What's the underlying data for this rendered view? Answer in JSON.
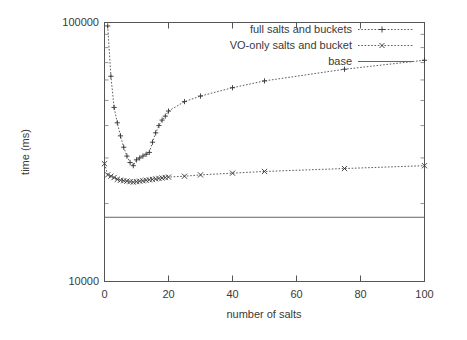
{
  "chart_data": {
    "type": "line",
    "title": "",
    "xlabel": "number of salts",
    "ylabel": "time (ms)",
    "xlim": [
      0,
      100
    ],
    "ylim": [
      10000,
      100000
    ],
    "yscale": "log",
    "xscale": "linear",
    "grid": false,
    "legend_position": "top-right",
    "xticks": [
      0,
      20,
      40,
      60,
      80,
      100
    ],
    "xtick_labels": [
      "0",
      "20",
      "40",
      "60",
      "80",
      "100"
    ],
    "yticks": [
      10000,
      100000
    ],
    "ytick_labels": [
      "10000",
      "100000"
    ],
    "series": [
      {
        "name": "full salts and buckets",
        "marker": "plus",
        "linestyle": "dotted",
        "x": [
          1,
          2,
          3,
          4,
          5,
          6,
          7,
          8,
          9,
          10,
          11,
          12,
          13,
          14,
          15,
          16,
          17,
          18,
          19,
          20,
          25,
          30,
          40,
          50,
          75,
          100
        ],
        "y": [
          97000,
          62000,
          47000,
          41000,
          36500,
          33000,
          30500,
          28800,
          28000,
          29500,
          30000,
          30500,
          31000,
          31500,
          34500,
          37500,
          40000,
          42000,
          43500,
          45500,
          49500,
          52000,
          56000,
          59500,
          66000,
          71500
        ]
      },
      {
        "name": "VO-only salts and bucket",
        "marker": "cross",
        "linestyle": "dotted",
        "x": [
          0,
          1,
          2,
          3,
          4,
          5,
          6,
          7,
          8,
          9,
          10,
          11,
          12,
          13,
          14,
          15,
          16,
          17,
          18,
          19,
          20,
          25,
          30,
          40,
          50,
          75,
          100
        ],
        "y": [
          28500,
          25800,
          25500,
          25200,
          24800,
          24600,
          24500,
          24400,
          24300,
          24200,
          24300,
          24400,
          24500,
          24600,
          24700,
          24800,
          24900,
          25000,
          25100,
          25200,
          25300,
          25500,
          25800,
          26200,
          26600,
          27300,
          28000
        ]
      },
      {
        "name": "base",
        "marker": "none",
        "linestyle": "solid",
        "x": [
          0,
          100
        ],
        "y": [
          17700,
          17700
        ]
      }
    ]
  },
  "legend": {
    "entries": [
      {
        "label": "full salts and buckets",
        "style": "dotted-plus"
      },
      {
        "label": "VO-only salts and bucket",
        "style": "dotted-cross"
      },
      {
        "label": "base",
        "style": "solid"
      }
    ]
  },
  "axes": {
    "x_title": "number of salts",
    "y_title": "time (ms)",
    "x_tick_labels": [
      "0",
      "20",
      "40",
      "60",
      "80",
      "100"
    ],
    "y_tick_labels": [
      "100000",
      "10000"
    ]
  },
  "colors": {
    "background": "#ffffff",
    "axis": "#555555",
    "series_full": "#4a4a4a",
    "series_vo": "#4a4a4a",
    "series_base": "#666666",
    "text": "#3a3a3a"
  }
}
